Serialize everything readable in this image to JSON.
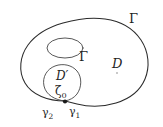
{
  "figure": {
    "background_color": "#ffffff",
    "stroke_color": "#2b2b2b",
    "width": 163,
    "height": 127,
    "labels": {
      "outer_boundary": "Γ",
      "inner_hole_boundary": "Γ",
      "domain": "D",
      "subdomain": "D′",
      "base_point": "ζ",
      "base_point_subscript": "0",
      "arc_left": "γ",
      "arc_left_subscript": "2",
      "arc_right": "γ",
      "arc_right_subscript": "1"
    }
  }
}
